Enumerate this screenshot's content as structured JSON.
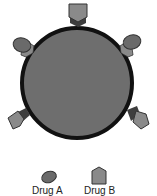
{
  "diagram": {
    "type": "cell-receptor-binding",
    "cell": {
      "fill": "#6e6e6e",
      "stroke": "#111111"
    },
    "receptor_color": "#3e3e3e",
    "drug_a_color": "#6a6a6a",
    "drug_b_color": "#8a8a8a",
    "receptors": [
      {
        "position": "top",
        "bound_drug": "Drug B"
      },
      {
        "position": "upper-left",
        "bound_drug": "Drug A"
      },
      {
        "position": "upper-right",
        "bound_drug": "Drug A"
      },
      {
        "position": "lower-left",
        "bound_drug": "Drug B"
      },
      {
        "position": "lower-right",
        "bound_drug": "Drug B"
      }
    ]
  },
  "legend": {
    "items": [
      {
        "label": "Drug A",
        "shape": "ellipse"
      },
      {
        "label": "Drug B",
        "shape": "pentagon"
      }
    ]
  }
}
